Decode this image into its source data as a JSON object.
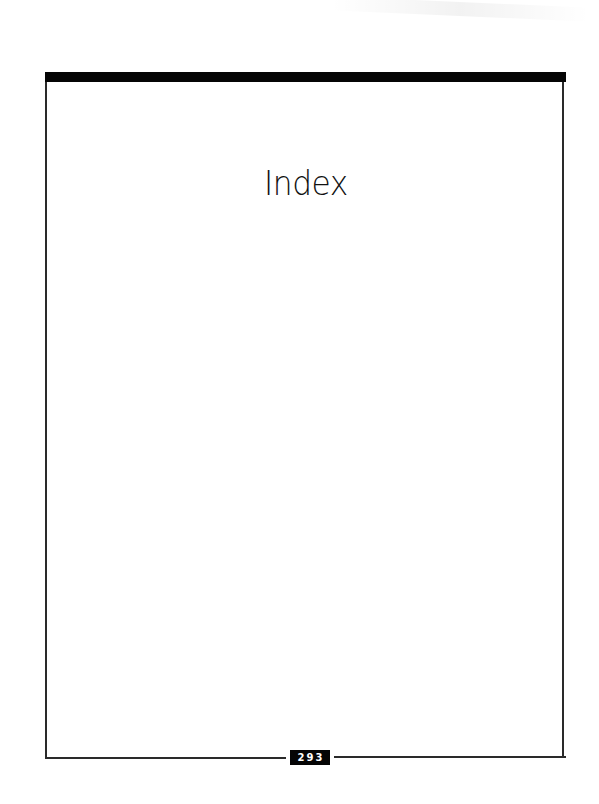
{
  "page": {
    "title": "Index",
    "page_number": "293"
  },
  "colors": {
    "rule": "#050505",
    "frame": "#2a2a2a",
    "background": "#ffffff"
  }
}
